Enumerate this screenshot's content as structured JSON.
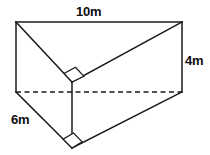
{
  "figure": {
    "name": "triangular-prism-diagram",
    "stroke_color": "#1a1a1a",
    "fill_color": "#ffffff",
    "text_color": "#0d0d0d",
    "labels": {
      "length": "10m",
      "height": "4m",
      "width": "6m"
    },
    "vertices": {
      "top_left": [
        16,
        22
      ],
      "top_right": [
        182,
        22
      ],
      "mid_left": [
        16,
        92
      ],
      "mid_right": [
        182,
        92
      ],
      "back_apex": [
        72,
        82
      ],
      "front_apex": [
        72,
        148
      ]
    },
    "edges": {
      "top_front_length": "top_left to top_right",
      "left_vertical": "top_left to mid_left",
      "right_vertical": "top_right to mid_right",
      "hidden_back_edge": "mid_left to mid_right",
      "left_diagonal_top": "top_left to back_apex",
      "right_diagonal_top": "back_apex to top_right",
      "apex_vertical": "back_apex to front_apex",
      "left_diagonal_bottom": "mid_left to front_apex",
      "right_diagonal_bottom": "front_apex to mid_right"
    },
    "right_angle_markers": 2
  }
}
